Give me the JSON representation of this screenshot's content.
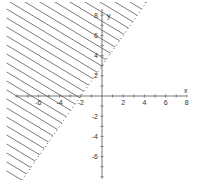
{
  "chart_data": {
    "type": "inequality-graph",
    "title": "",
    "xlabel": "x",
    "ylabel": "y",
    "xlim": [
      -8,
      8
    ],
    "ylim": [
      -8,
      8
    ],
    "grid": false,
    "x_ticks": [
      -6,
      -4,
      -2,
      2,
      4,
      6,
      8
    ],
    "y_ticks": [
      8,
      6,
      4,
      2,
      -2,
      -4,
      -6
    ],
    "boundary": {
      "equation": "y = 1.5x + 3",
      "style": "dotted",
      "points": [
        [
          -2,
          0
        ],
        [
          0,
          3
        ]
      ]
    },
    "shaded_region": {
      "side": "above-left",
      "pattern": "diagonal-hatch",
      "inequality": "y > 1.5x + 3"
    }
  },
  "labels": {
    "x_axis": "x",
    "y_axis": "y",
    "x_ticks": [
      "-6",
      "-4",
      "-2",
      "2",
      "4",
      "6",
      "8"
    ],
    "y_ticks": [
      "8",
      "6",
      "4",
      "2",
      "-2",
      "-4",
      "-6"
    ]
  },
  "colors": {
    "axis": "#555555",
    "hatch": "#444444",
    "boundary": "#555555"
  }
}
